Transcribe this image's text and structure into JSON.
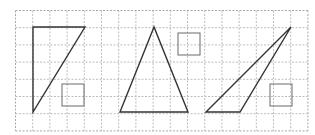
{
  "grid": {
    "x0": 15.5,
    "y0": 10.5,
    "cell": 17.2,
    "cols": 17,
    "rows": 7,
    "line_color": "#bdbdbd",
    "border_color": "#a8a8a8"
  },
  "shapes": {
    "triangles": [
      {
        "name": "right-triangle",
        "points": [
          [
            33,
            27
          ],
          [
            85,
            27
          ],
          [
            33,
            112
          ]
        ]
      },
      {
        "name": "isosceles-triangle",
        "points": [
          [
            154,
            27
          ],
          [
            120,
            112
          ],
          [
            188,
            112
          ]
        ]
      },
      {
        "name": "obtuse-triangle",
        "points": [
          [
            206,
            112
          ],
          [
            291,
            27
          ],
          [
            240,
            112
          ]
        ]
      }
    ],
    "squares": [
      {
        "name": "small-square-1",
        "x": 62,
        "y": 84,
        "size": 22
      },
      {
        "name": "small-square-2",
        "x": 178,
        "y": 33,
        "size": 22
      },
      {
        "name": "small-square-3",
        "x": 270,
        "y": 84,
        "size": 22
      }
    ],
    "triangle_color": "#333333",
    "square_color": "#777777"
  }
}
